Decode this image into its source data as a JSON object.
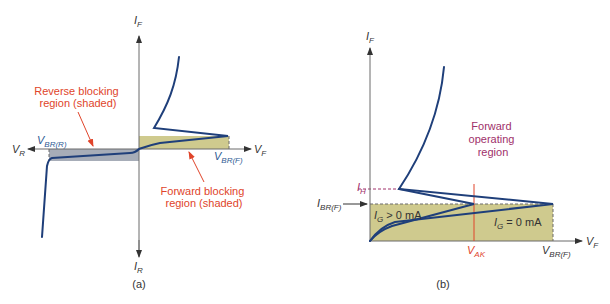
{
  "colors": {
    "curve": "#1f3f7a",
    "forward_fill": "#cfca8e",
    "reverse_fill": "#a7adb8",
    "annotation_red": "#e0442a",
    "annotation_magenta": "#a0306a",
    "axis": "#6b6b6b"
  },
  "panel_a": {
    "caption": "(a)",
    "axis_labels": {
      "if_main": "I",
      "if_sub": "F",
      "ir_main": "I",
      "ir_sub": "R",
      "vf_main": "V",
      "vf_sub": "F",
      "vr_main": "V",
      "vr_sub": "R"
    },
    "vbr_r": {
      "main": "V",
      "sub": "BR(R)"
    },
    "vbr_f": {
      "main": "V",
      "sub": "BR(F)"
    },
    "reverse_note": {
      "line1": "Reverse blocking",
      "line2": "region (shaded)"
    },
    "forward_note": {
      "line1": "Forward blocking",
      "line2": "region (shaded)"
    }
  },
  "panel_b": {
    "caption": "(b)",
    "axis_labels": {
      "if_main": "I",
      "if_sub": "F",
      "vf_main": "V",
      "vf_sub": "F"
    },
    "ih": {
      "main": "I",
      "sub": "H"
    },
    "ibr_f": {
      "main": "I",
      "sub": "BR(F)"
    },
    "vak": {
      "main": "V",
      "sub": "AK"
    },
    "vbr_f": {
      "main": "V",
      "sub": "BR(F)"
    },
    "ig_pos": {
      "main": "I",
      "sub": "G",
      "rest": " > 0 mA"
    },
    "ig_zero": {
      "main": "I",
      "sub": "G",
      "rest": " = 0 mA"
    },
    "forward_region": {
      "line1": "Forward",
      "line2": "operating",
      "line3": "region"
    }
  }
}
